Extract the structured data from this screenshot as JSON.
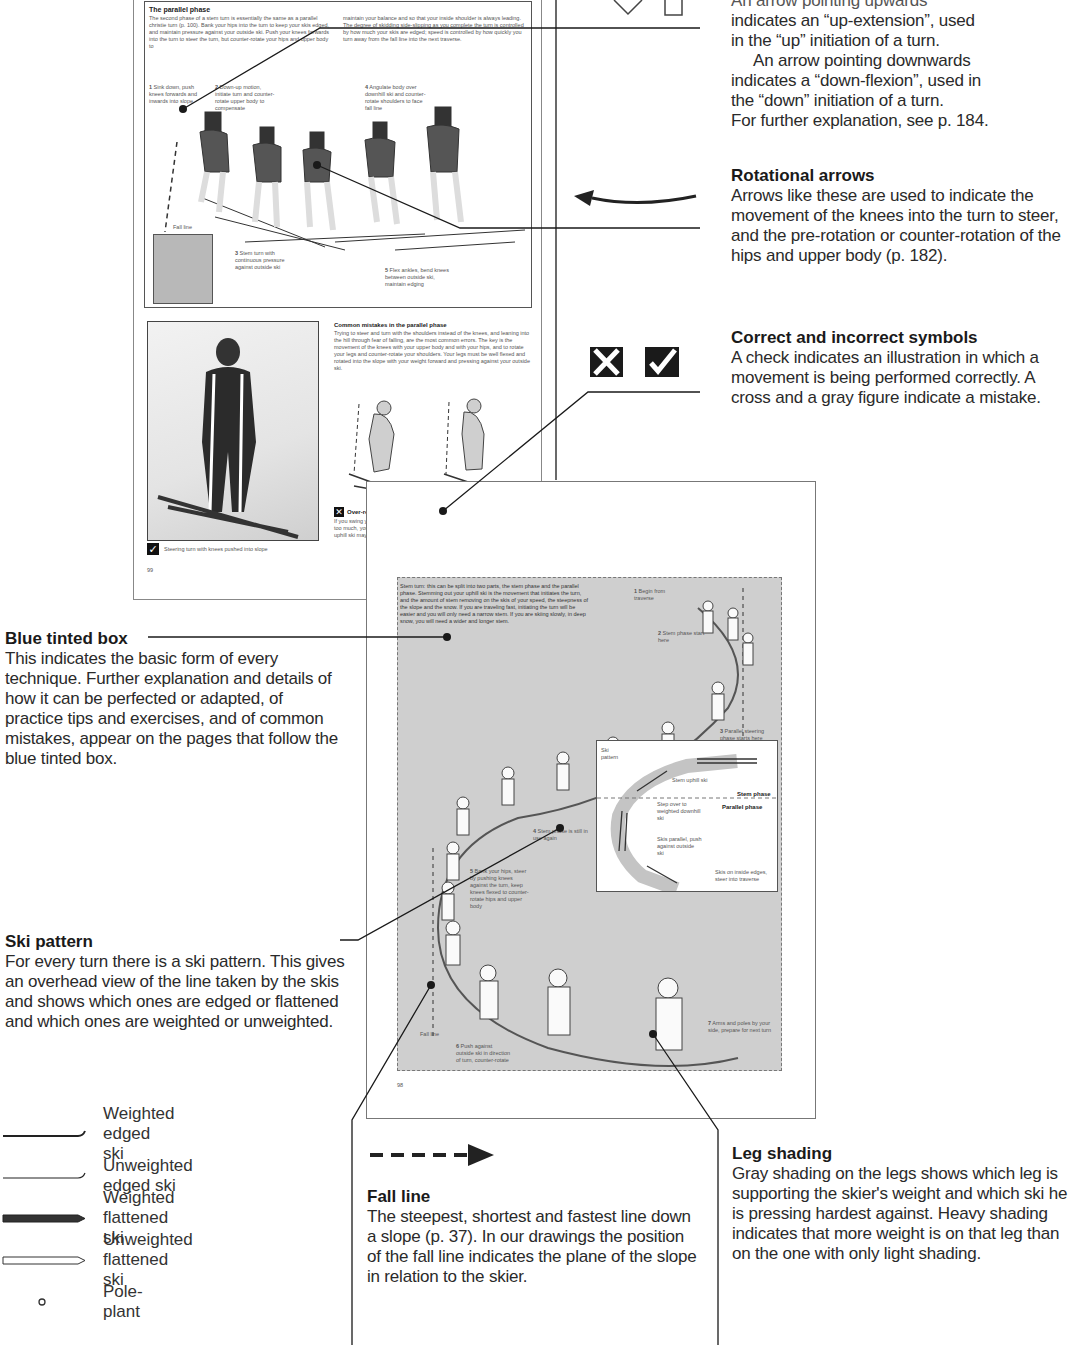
{
  "top_right": {
    "partial_line": "An arrow pointing upwards",
    "lines": [
      "indicates an “up-extension”, used",
      "in the “up” initiation of a turn.",
      "An arrow pointing downwards",
      "indicates a “down-flexion”, used in",
      "the “down” initiation of a turn.",
      "For further explanation, see p. 184."
    ]
  },
  "rotational_arrows": {
    "heading": "Rotational arrows",
    "body": "Arrows like these are used to indicate the movement of the knees into the turn to steer, and the pre-rotation or counter-rotation of the hips and upper body (p. 182)."
  },
  "correct_symbols": {
    "heading": "Correct and incorrect symbols",
    "body": "A check indicates an illustration in which a movement is being performed correctly. A cross and a gray figure indicate a mistake."
  },
  "blue_tinted_box": {
    "heading": "Blue tinted box",
    "body": "This indicates the basic form of every technique. Further explanation and details of how it can be perfected or adapted, of practice tips and exercises, and of common mistakes, appear on the pages that follow the blue tinted box."
  },
  "ski_pattern": {
    "heading": "Ski pattern",
    "body": "For every turn there is a ski pattern. This gives an overhead view of the line taken by the skis and shows which ones are edged or flattened and which ones are weighted or unweighted."
  },
  "ski_legend": [
    {
      "label": "Weighted edged ski",
      "icon": "weighted-edged-ski-icon"
    },
    {
      "label": "Unweighted edged ski",
      "icon": "unweighted-edged-ski-icon"
    },
    {
      "label": "Weighted flattened ski",
      "icon": "weighted-flattened-ski-icon"
    },
    {
      "label": "Unweighted flattened ski",
      "icon": "unweighted-flattened-ski-icon"
    },
    {
      "label": "Pole-plant",
      "icon": "pole-plant-icon"
    }
  ],
  "fall_line": {
    "heading": "Fall line",
    "body": "The steepest, shortest and fastest line down a slope (p. 37). In our drawings the position of the fall line indicates the plane of the slope in relation to the skier."
  },
  "leg_shading": {
    "heading": "Leg shading",
    "body": "Gray shading on the legs shows which leg is supporting the skier's weight and which ski he is pressing hardest against. Heavy shading indicates that more weight is on that leg than on the one with only light shading."
  },
  "page_a": {
    "section_title": "The parallel phase",
    "intro_col1": "The second phase of a stem turn is essentially the same as a parallel christie turn (p. 100). Bank your hips into the turn to keep your skis edged, and maintain pressure against your outside ski. Push your knees forwards into the turn to steer the turn, but counter-rotate your hips and upper body to",
    "intro_col2": "maintain your balance and so that your inside shoulder is always leading. The degree of skidding side-slipping as you complete the turn is controlled by how much your skis are edged; speed is controlled by how quickly you turn away from the fall line into the next traverse.",
    "steps": [
      {
        "n": "1",
        "text": "Sink down, push knees forwards and inwards into slope"
      },
      {
        "n": "2",
        "text": "Down-up motion, initiate turn and counter-rotate upper body to compensate"
      },
      {
        "n": "3",
        "text": "Stem turn with continuous pressure against outside ski"
      },
      {
        "n": "4",
        "text": "Angulate body over downhill ski and counter-rotate shoulders to face fall line"
      },
      {
        "n": "5",
        "text": "Flex ankles, bend knees between outside ski, maintain edging"
      }
    ],
    "fall_line_label": "Fall line",
    "mistakes_title": "Common mistakes in the parallel phase",
    "mistakes_body": "Trying to steer and turn with the shoulders instead of the knees, and leaning into the hill through fear of falling, are the most common errors. The key is the movement of the knees with your upper body and with your hips, and to rotate your legs and counter-rotate your shoulders. Your legs must be well flexed and rotated into the slope with your weight forward and pressing against your outside ski.",
    "photo_caption": "Steering turn with knees pushed into slope",
    "mistake1_title": "Over-rotation",
    "mistake1_body": "If you swing your upper body around too much, you lose control and the uphill ski may slide away.",
    "mistake2_title": "Stiff outside leg",
    "mistake2_body": "Bend both knees as you turn down. A stiff outside leg results in poor edging, leaning into slope and inability to steer.",
    "page_number": "99"
  },
  "page_b": {
    "intro_partial": "Stem turn: this can be split into two parts, the stem phase and the parallel phase. Stemming out your uphill ski is the movement that initiates the turn, and the amount of stem removing on the skis of your speed, the steepness of the slope and the snow. If you are traveling fast, initiating the turn will be easier and you will only need a narrow stem. If you are skiing slowly, in deep snow, you will need a wider and longer stem.",
    "steps": [
      {
        "n": "1",
        "text": "Begin from traverse"
      },
      {
        "n": "2",
        "text": "Stem phase start here"
      },
      {
        "n": "3",
        "text": "Parallel steering phase starts here"
      },
      {
        "n": "4",
        "text": "Stem phase is still in use again"
      },
      {
        "n": "5",
        "text": "Bank your hips, steer by pushing knees against the turn, keep knees flexed to counter-rotate hips and upper body"
      },
      {
        "n": "6",
        "text": "Push against outside ski in direction of turn, counter-rotate"
      },
      {
        "n": "7",
        "text": "Arms and poles by your side, prepare for next turn"
      }
    ],
    "ski_pattern_box": {
      "title": "Ski pattern",
      "labels": [
        "Stem uphill ski",
        "Stem phase",
        "Step over to weighted downhill ski",
        "Parallel phase",
        "Skis parallel, push against outside ski",
        "Skis on inside edges, steer into traverse"
      ]
    },
    "fall_line_label": "Fall line",
    "page_number": "98"
  },
  "colors": {
    "text": "#2a2a2a",
    "heading": "#1a1a1a",
    "tint_box": "#cfcfcf",
    "leader_line": "#1a1a1a"
  }
}
